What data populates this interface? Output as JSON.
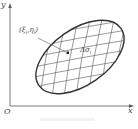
{
  "diagram": {
    "axes": {
      "x_label": "x",
      "y_label": "y",
      "origin_label": "O"
    },
    "point_label": "(ξ",
    "point_label_sub1": "i",
    "point_label_mid": ",η",
    "point_label_sub2": "i",
    "point_label_end": ")",
    "area_label": "Δσ",
    "area_label_sub": "i",
    "colors": {
      "outline": "#333333",
      "grid": "#555555",
      "axis": "#555555",
      "background": "#ffffff"
    }
  }
}
